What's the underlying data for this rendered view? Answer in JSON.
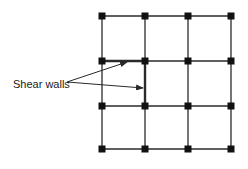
{
  "figure": {
    "label": "Shear walls",
    "colors": {
      "line": "#2a2a2a",
      "node": "#111111",
      "background": "#ffffff"
    },
    "grid": {
      "columns_x": [
        102,
        145,
        188,
        231
      ],
      "rows_y": [
        16,
        61,
        106,
        149
      ],
      "node_size": 7
    },
    "shear_walls": [
      {
        "orientation": "horizontal",
        "row": 1,
        "from_col": 0,
        "to_col": 1
      },
      {
        "orientation": "vertical",
        "col": 1,
        "from_row": 1,
        "to_row": 2
      }
    ],
    "annotation": {
      "text_x": 13,
      "text_y": 78,
      "origin": [
        67,
        82
      ],
      "targets": [
        [
          127,
          62
        ],
        [
          143,
          88
        ]
      ]
    }
  }
}
